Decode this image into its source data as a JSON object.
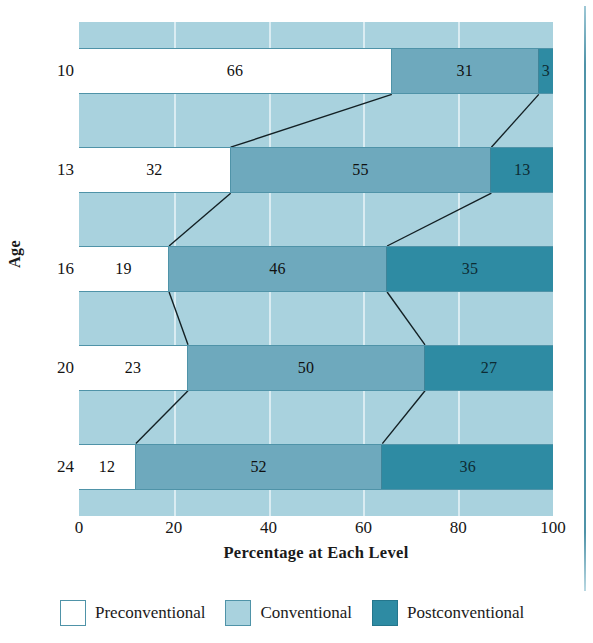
{
  "chart_data": {
    "type": "bar",
    "orientation": "horizontal",
    "stacked": true,
    "title": "",
    "xlabel": "Percentage at Each Level",
    "ylabel": "Age",
    "categories": [
      "10",
      "13",
      "16",
      "20",
      "24"
    ],
    "xticks": [
      "0",
      "20",
      "40",
      "60",
      "80",
      "100"
    ],
    "xlim": [
      0,
      100
    ],
    "grid": true,
    "legend_position": "bottom",
    "series": [
      {
        "name": "Preconventional",
        "color": "#ffffff",
        "values": [
          66,
          32,
          19,
          23,
          12
        ]
      },
      {
        "name": "Conventional",
        "color": "#6ea9bd",
        "values": [
          31,
          55,
          46,
          50,
          52
        ]
      },
      {
        "name": "Postconventional",
        "color": "#2e8ba3",
        "values": [
          3,
          13,
          35,
          27,
          36
        ]
      }
    ],
    "rows": [
      {
        "age": "10",
        "pre": 66,
        "con": 31,
        "post": 3
      },
      {
        "age": "13",
        "pre": 32,
        "con": 55,
        "post": 13
      },
      {
        "age": "16",
        "pre": 19,
        "con": 46,
        "post": 35
      },
      {
        "age": "20",
        "pre": 23,
        "con": 50,
        "post": 27
      },
      {
        "age": "24",
        "pre": 12,
        "con": 52,
        "post": 36
      }
    ]
  },
  "axis": {
    "x_title": "Percentage at Each Level",
    "y_title": "Age",
    "x_ticks": [
      {
        "label": "0",
        "value": 0
      },
      {
        "label": "20",
        "value": 20
      },
      {
        "label": "40",
        "value": 40
      },
      {
        "label": "60",
        "value": 60
      },
      {
        "label": "80",
        "value": 80
      },
      {
        "label": "100",
        "value": 100
      }
    ],
    "y_ticks": [
      "10",
      "13",
      "16",
      "20",
      "24"
    ]
  },
  "legend": {
    "items": [
      {
        "label": "Preconventional",
        "swatch": "white-square-icon",
        "color": "#ffffff"
      },
      {
        "label": "Conventional",
        "swatch": "light-blue-square-icon",
        "color": "#a9d2de"
      },
      {
        "label": "Postconventional",
        "swatch": "teal-square-icon",
        "color": "#2e8ba3"
      }
    ]
  },
  "colors": {
    "plot_background": "#a9d2de",
    "preconventional": "#ffffff",
    "conventional": "#6ea9bd",
    "postconventional": "#2e8ba3",
    "border": "#4f93a8",
    "gridline": "#e3f1f6",
    "text": "#1a1a1a"
  }
}
